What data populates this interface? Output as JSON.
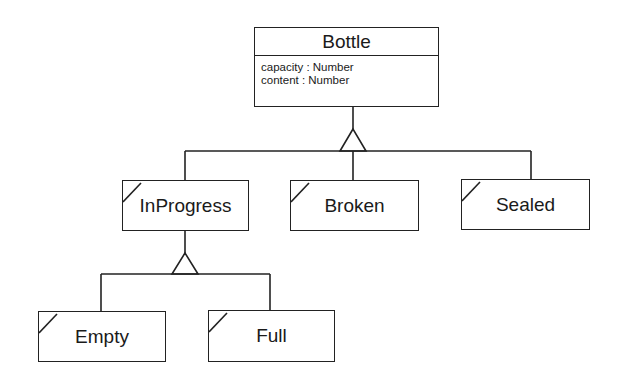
{
  "diagram": {
    "type": "UML class generalization hierarchy",
    "root": {
      "name": "Bottle",
      "attributes": [
        "capacity : Number",
        "content : Number"
      ]
    },
    "children": [
      {
        "name": "InProgress",
        "children": [
          {
            "name": "Empty"
          },
          {
            "name": "Full"
          }
        ]
      },
      {
        "name": "Broken"
      },
      {
        "name": "Sealed"
      }
    ],
    "colors": {
      "line": "#222222",
      "background": "#ffffff"
    }
  },
  "labels": {
    "bottle": "Bottle",
    "attr_capacity": "capacity : Number",
    "attr_content": "content : Number",
    "inprogress": "InProgress",
    "broken": "Broken",
    "sealed": "Sealed",
    "empty": "Empty",
    "full": "Full"
  }
}
